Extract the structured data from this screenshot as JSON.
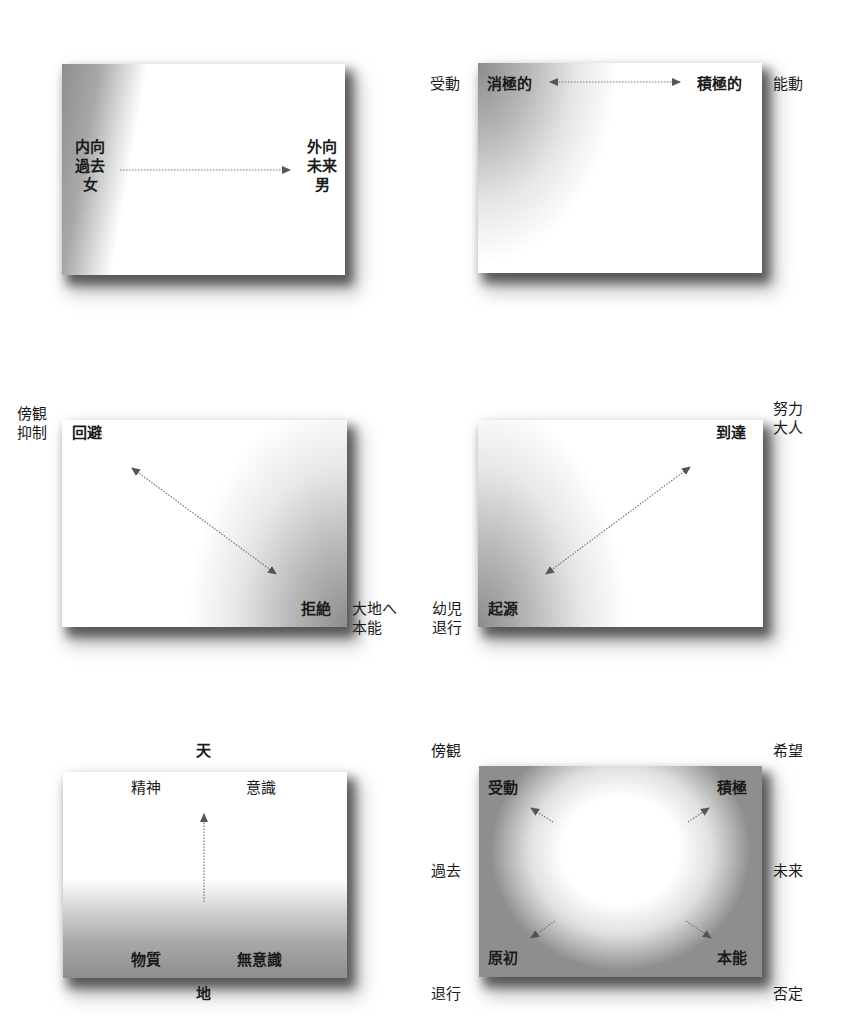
{
  "diagrams": [
    {
      "id": "introvert-extravert",
      "inner": {
        "left": [
          "内向",
          "過去",
          "女"
        ],
        "right": [
          "外向",
          "未来",
          "男"
        ]
      },
      "arrow": "left-to-right"
    },
    {
      "id": "passive-active",
      "outer": {
        "left": "受動",
        "right": "能動"
      },
      "inner": {
        "left": "消極的",
        "right": "積極的"
      },
      "arrow": "bidirectional-horizontal"
    },
    {
      "id": "avoid-reject",
      "outer": {
        "top_left": [
          "傍観",
          "抑制"
        ],
        "bottom_right": [
          "大地へ",
          "本能"
        ]
      },
      "inner": {
        "top_left": "回避",
        "bottom_right": "拒絶"
      },
      "arrow": "bidirectional-diagonal-down"
    },
    {
      "id": "origin-reach",
      "outer": {
        "top_right": [
          "努力",
          "大人"
        ],
        "bottom_left": [
          "幼児",
          "退行"
        ]
      },
      "inner": {
        "top_right": "到達",
        "bottom_left": "起源"
      },
      "arrow": "bidirectional-diagonal-up"
    },
    {
      "id": "heaven-earth",
      "outer": {
        "top": "天",
        "bottom": "地"
      },
      "inner": {
        "top_left": "精神",
        "top_right": "意識",
        "bottom_left": "物質",
        "bottom_right": "無意識"
      },
      "arrow": "bottom-to-top"
    },
    {
      "id": "four-corners",
      "outer": {
        "top_left": "傍観",
        "top_right": "希望",
        "middle_left": "過去",
        "middle_right": "未来",
        "bottom_left": "退行",
        "bottom_right": "否定"
      },
      "inner": {
        "top_left": "受動",
        "top_right": "積極",
        "bottom_left": "原初",
        "bottom_right": "本能"
      },
      "arrow": "center-to-four-corners"
    }
  ],
  "colors": {
    "arrow": "#555555",
    "text": "#1a1a1a",
    "shade": "#8a8a8a"
  }
}
